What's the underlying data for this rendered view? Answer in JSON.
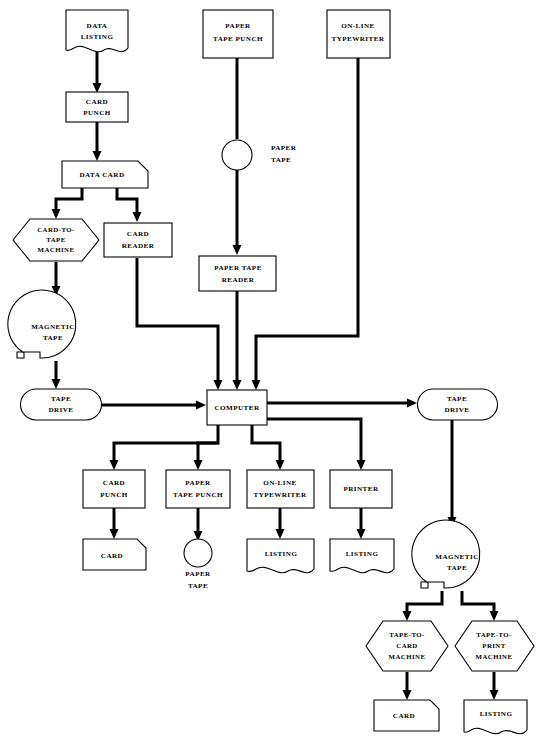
{
  "diagram": {
    "type": "flowchart",
    "background_color": "#ffffff",
    "line_color": "#000000",
    "nodes": [
      {
        "id": "data-listing",
        "label_lines": [
          "DATA",
          "LISTING"
        ],
        "shape": "document"
      },
      {
        "id": "card-punch-top",
        "label_lines": [
          "CARD",
          "PUNCH"
        ],
        "shape": "process"
      },
      {
        "id": "data-card",
        "label_lines": [
          "DATA  CARD"
        ],
        "shape": "punched-card"
      },
      {
        "id": "card-to-tape",
        "label_lines": [
          "CARD-TO-",
          "TAPE",
          "MACHINE"
        ],
        "shape": "hexagon"
      },
      {
        "id": "card-reader",
        "label_lines": [
          "CARD",
          "READER"
        ],
        "shape": "process"
      },
      {
        "id": "magnetic-tape-left",
        "label_lines": [
          "MAGNETIC",
          "TAPE"
        ],
        "shape": "magnetic-tape"
      },
      {
        "id": "tape-drive-left",
        "label_lines": [
          "TAPE",
          "DRIVE"
        ],
        "shape": "tape-drive"
      },
      {
        "id": "paper-tape-punch-top",
        "label_lines": [
          "PAPER",
          "TAPE PUNCH"
        ],
        "shape": "process"
      },
      {
        "id": "paper-tape-top",
        "label_lines": [
          "PAPER",
          "TAPE"
        ],
        "shape": "paper-tape"
      },
      {
        "id": "paper-tape-reader",
        "label_lines": [
          "PAPER TAPE",
          "READER"
        ],
        "shape": "process"
      },
      {
        "id": "online-typewriter-top",
        "label_lines": [
          "ON-LINE",
          "TYPEWRITER"
        ],
        "shape": "process"
      },
      {
        "id": "computer",
        "label_lines": [
          "COMPUTER"
        ],
        "shape": "process"
      },
      {
        "id": "card-punch-out",
        "label_lines": [
          "CARD",
          "PUNCH"
        ],
        "shape": "process"
      },
      {
        "id": "paper-tape-punch-out",
        "label_lines": [
          "PAPER",
          "TAPE  PUNCH"
        ],
        "shape": "process"
      },
      {
        "id": "online-typewriter-out",
        "label_lines": [
          "ON-LINE",
          "TYPEWRITER"
        ],
        "shape": "process"
      },
      {
        "id": "printer",
        "label_lines": [
          "PRINTER"
        ],
        "shape": "process"
      },
      {
        "id": "card-out",
        "label_lines": [
          "CARD"
        ],
        "shape": "punched-card"
      },
      {
        "id": "paper-tape-out",
        "label_lines": [
          "PAPER",
          "TAPE"
        ],
        "shape": "paper-tape"
      },
      {
        "id": "listing-typewriter",
        "label_lines": [
          "LISTING"
        ],
        "shape": "document"
      },
      {
        "id": "listing-printer",
        "label_lines": [
          "LISTING"
        ],
        "shape": "document"
      },
      {
        "id": "tape-drive-right",
        "label_lines": [
          "TAPE",
          "DRIVE"
        ],
        "shape": "tape-drive"
      },
      {
        "id": "magnetic-tape-right",
        "label_lines": [
          "MAGNETIC",
          "TAPE"
        ],
        "shape": "magnetic-tape"
      },
      {
        "id": "tape-to-card",
        "label_lines": [
          "TAPE-TO-",
          "CARD",
          "MACHINE"
        ],
        "shape": "hexagon"
      },
      {
        "id": "tape-to-print",
        "label_lines": [
          "TAPE-TO-",
          "PRINT",
          "MACHINE"
        ],
        "shape": "hexagon"
      },
      {
        "id": "card-final",
        "label_lines": [
          "CARD"
        ],
        "shape": "punched-card"
      },
      {
        "id": "listing-final",
        "label_lines": [
          "LISTING"
        ],
        "shape": "document"
      }
    ],
    "labels": {
      "data_listing_1": "DATA",
      "data_listing_2": "LISTING",
      "card_punch_top_1": "CARD",
      "card_punch_top_2": "PUNCH",
      "data_card": "DATA  CARD",
      "card_to_tape_1": "CARD-TO-",
      "card_to_tape_2": "TAPE",
      "card_to_tape_3": "MACHINE",
      "card_reader_1": "CARD",
      "card_reader_2": "READER",
      "magnetic_tape_left_1": "MAGNETIC",
      "magnetic_tape_left_2": "TAPE",
      "tape_drive_left_1": "TAPE",
      "tape_drive_left_2": "DRIVE",
      "paper_tape_punch_top_1": "PAPER",
      "paper_tape_punch_top_2": "TAPE PUNCH",
      "paper_tape_top_1": "PAPER",
      "paper_tape_top_2": "TAPE",
      "paper_tape_reader_1": "PAPER TAPE",
      "paper_tape_reader_2": "READER",
      "online_typewriter_top_1": "ON-LINE",
      "online_typewriter_top_2": "TYPEWRITER",
      "computer": "COMPUTER",
      "card_punch_out_1": "CARD",
      "card_punch_out_2": "PUNCH",
      "paper_tape_punch_out_1": "PAPER",
      "paper_tape_punch_out_2": "TAPE  PUNCH",
      "online_typewriter_out_1": "ON-LINE",
      "online_typewriter_out_2": "TYPEWRITER",
      "printer": "PRINTER",
      "card_out": "CARD",
      "paper_tape_out_1": "PAPER",
      "paper_tape_out_2": "TAPE",
      "listing_typewriter": "LISTING",
      "listing_printer": "LISTING",
      "tape_drive_right_1": "TAPE",
      "tape_drive_right_2": "DRIVE",
      "magnetic_tape_right_1": "MAGNETIC",
      "magnetic_tape_right_2": "TAPE",
      "tape_to_card_1": "TAPE-TO-",
      "tape_to_card_2": "CARD",
      "tape_to_card_3": "MACHINE",
      "tape_to_print_1": "TAPE-TO-",
      "tape_to_print_2": "PRINT",
      "tape_to_print_3": "MACHINE",
      "card_final": "CARD",
      "listing_final": "LISTING"
    }
  }
}
